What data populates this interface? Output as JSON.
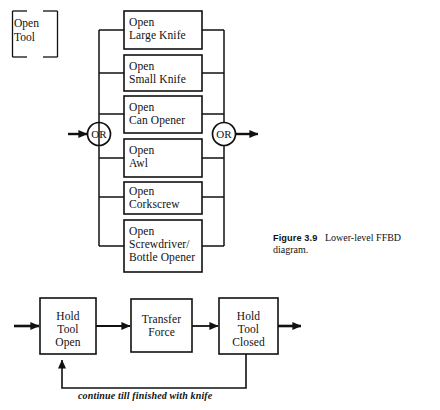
{
  "figure": {
    "caption_label": "Figure 3.9",
    "caption_text": "Lower-level FFBD diagram."
  },
  "top_diagram": {
    "reference_block": {
      "name": "reference-block",
      "text": "Open\nTool"
    },
    "input_arrow": "input-arrow",
    "output_arrow": "output-arrow",
    "left_gate": {
      "label": "OR"
    },
    "right_gate": {
      "label": "OR"
    },
    "functions": [
      {
        "id": "open-large-knife",
        "text": "Open\nLarge Knife"
      },
      {
        "id": "open-small-knife",
        "text": "Open\nSmall Knife"
      },
      {
        "id": "open-can-opener",
        "text": "Open\nCan Opener"
      },
      {
        "id": "open-awl",
        "text": "Open\nAwl"
      },
      {
        "id": "open-corkscrew",
        "text": "Open\nCorkscrew"
      },
      {
        "id": "open-screwdriver-bottle-opener",
        "text": "Open\nScrewdriver/\nBottle Opener"
      }
    ]
  },
  "bottom_diagram": {
    "functions": [
      {
        "id": "hold-tool-open",
        "text": "Hold\nTool\nOpen"
      },
      {
        "id": "transfer-force",
        "text": "Transfer\nForce"
      },
      {
        "id": "hold-tool-closed",
        "text": "Hold\nTool\nClosed"
      }
    ],
    "feedback_label": "continue till finished with knife"
  },
  "style": {
    "line_color": "#111111",
    "background": "#ffffff"
  }
}
